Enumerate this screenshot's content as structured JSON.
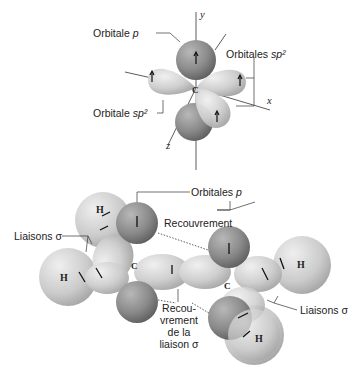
{
  "top_diagram": {
    "axes": {
      "y": "y",
      "x": "x",
      "z": "z"
    },
    "center_atom": "C",
    "labels": {
      "orbital_p": {
        "text": "Orbitale ",
        "italic": "p"
      },
      "orbitals_sp2": {
        "text": "Orbitales ",
        "italic": "sp²"
      },
      "orbital_sp2": {
        "text": "Orbitale ",
        "italic": "sp²"
      }
    }
  },
  "bottom_diagram": {
    "carbon_left": "C",
    "carbon_right": "C",
    "hydrogens": [
      "H",
      "H",
      "H",
      "H"
    ],
    "labels": {
      "orbitals_p": {
        "text": "Orbitales ",
        "italic": "p"
      },
      "overlap": "Recouvrement",
      "sigma_bonds_left": "Liaisons σ",
      "sigma_bonds_right": "Liaisons σ",
      "sigma_overlap_lines": [
        "Recou-",
        "vrement",
        "de la",
        "liaison σ"
      ]
    }
  },
  "colors": {
    "sp2_light": "#d4d4d4",
    "p_dark": "#8a8a8a",
    "h_sphere": "#cfcfcf",
    "line": "#333333"
  }
}
